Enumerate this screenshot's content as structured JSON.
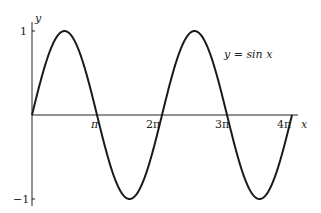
{
  "chart_data": {
    "type": "line",
    "title": "",
    "xlabel": "x",
    "ylabel": "y",
    "annotation": "y = sin x",
    "function": "sin(x)",
    "xlim": [
      0,
      12.566
    ],
    "ylim": [
      -1,
      1
    ],
    "x_ticks": [
      "π",
      "2π",
      "3π",
      "4π"
    ],
    "y_ticks": [
      "1",
      "−1"
    ],
    "grid": false,
    "legend": null,
    "series": [
      {
        "name": "y = sin x",
        "x": [
          0,
          0.785,
          1.571,
          2.356,
          3.142,
          3.927,
          4.712,
          5.498,
          6.283,
          7.069,
          7.854,
          8.639,
          9.425,
          10.21,
          10.996,
          11.781,
          12.566
        ],
        "values": [
          0,
          0.707,
          1,
          0.707,
          0,
          -0.707,
          -1,
          -0.707,
          0,
          0.707,
          1,
          0.707,
          0,
          -0.707,
          -1,
          -0.707,
          0
        ]
      }
    ]
  },
  "labels": {
    "y_axis": "y",
    "x_axis": "x",
    "y_max": "1",
    "y_min": "−1",
    "pi": "π",
    "two_pi": "2π",
    "three_pi": "3π",
    "four_pi": "4π",
    "equation": "y = sin x"
  }
}
